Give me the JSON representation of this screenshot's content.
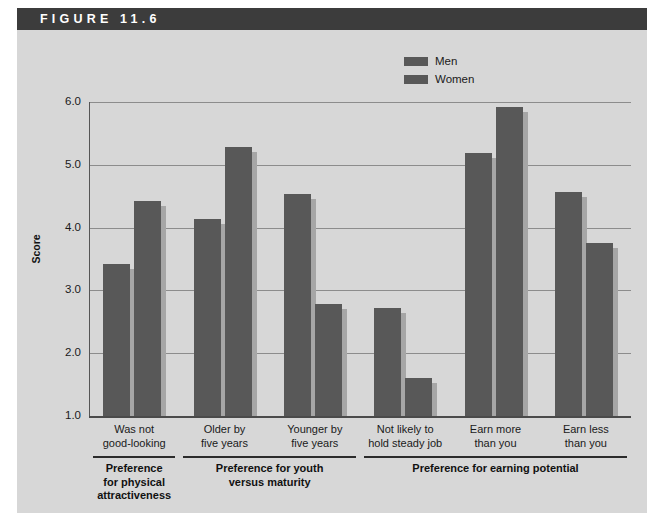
{
  "figure": {
    "header_label": "FIGURE 11.6",
    "header_bg": "#3c3c3c",
    "card_bg": "#d7d7d7",
    "page_bg": "#ffffff"
  },
  "legend": {
    "position": "top-right",
    "entries": [
      {
        "label": "Men",
        "color": "#585858"
      },
      {
        "label": "Women",
        "color": "#585858"
      }
    ]
  },
  "chart_data": {
    "type": "bar",
    "title": "FIGURE 11.6",
    "xlabel": "",
    "ylabel": "Score",
    "ylim": [
      1.0,
      6.0
    ],
    "yticks": [
      1.0,
      2.0,
      3.0,
      4.0,
      5.0,
      6.0
    ],
    "ytick_labels": [
      "1.0",
      "2.0",
      "3.0",
      "4.0",
      "5.0",
      "6.0"
    ],
    "grid": true,
    "legend_position": "top-right",
    "bar_color": "#585858",
    "bar_shadow_color": "#a6a6a6",
    "categories": [
      "Was not good-looking",
      "Older by five years",
      "Younger by five years",
      "Not likely to hold steady job",
      "Earn more than you",
      "Earn less than you"
    ],
    "category_lines": [
      [
        "Was not",
        "good-looking"
      ],
      [
        "Older by",
        "five years"
      ],
      [
        "Younger by",
        "five years"
      ],
      [
        "Not likely to",
        "hold steady job"
      ],
      [
        "Earn more",
        "than you"
      ],
      [
        "Earn less",
        "than you"
      ]
    ],
    "series": [
      {
        "name": "Men",
        "values": [
          3.42,
          4.14,
          4.53,
          2.72,
          5.18,
          4.56
        ]
      },
      {
        "name": "Women",
        "values": [
          4.42,
          5.28,
          2.78,
          1.6,
          5.92,
          3.75
        ]
      }
    ],
    "groups": [
      {
        "label_lines": [
          "Preference",
          "for physical",
          "attractiveness"
        ],
        "categories": [
          0
        ]
      },
      {
        "label_lines": [
          "Preference for youth",
          "versus maturity"
        ],
        "categories": [
          1,
          2
        ]
      },
      {
        "label_lines": [
          "Preference for earning potential"
        ],
        "categories": [
          3,
          4,
          5
        ]
      }
    ]
  }
}
